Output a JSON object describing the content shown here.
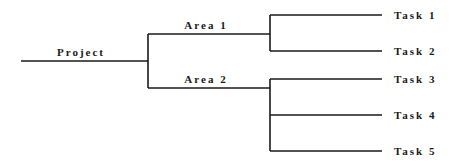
{
  "diagram": {
    "type": "tree",
    "line_color": "#1a1a1a",
    "root": {
      "label": "Project",
      "children": [
        {
          "label": "Area 1",
          "children": [
            {
              "label": "Task 1"
            },
            {
              "label": "Task 2"
            }
          ]
        },
        {
          "label": "Area 2",
          "children": [
            {
              "label": "Task 3"
            },
            {
              "label": "Task 4"
            },
            {
              "label": "Task 5"
            }
          ]
        }
      ]
    }
  },
  "labels": {
    "project": "Project",
    "area1": "Area 1",
    "area2": "Area 2",
    "task1": "Task 1",
    "task2": "Task 2",
    "task3": "Task 3",
    "task4": "Task 4",
    "task5": "Task 5"
  }
}
